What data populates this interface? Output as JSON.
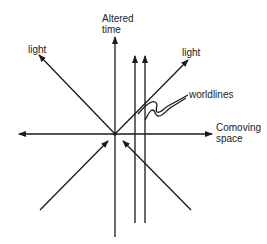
{
  "diagram": {
    "labels": {
      "time_axis_line1": "Altered",
      "time_axis_line2": "time",
      "space_axis_line1": "Comoving",
      "space_axis_line2": "space",
      "light_left": "light",
      "light_right": "light",
      "worldlines": "worldlines"
    },
    "colors": {
      "ink": "#1a1a1a",
      "background": "#ffffff"
    }
  }
}
